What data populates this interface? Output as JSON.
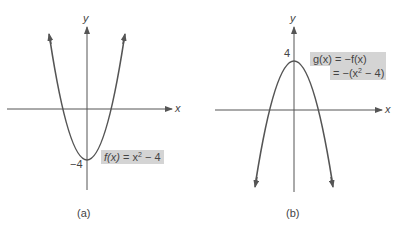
{
  "panels": [
    {
      "id": "a",
      "caption": "(a)",
      "x_axis_label": "x",
      "y_axis_label": "y",
      "y_intercept_label": "−4",
      "function_label": {
        "lhs": "f(x)",
        "rhs_prefix": "= x",
        "exponent": "2",
        "rhs_suffix": " − 4"
      },
      "equation": "f(x) = x^2 - 4",
      "vertex": [
        0,
        -4
      ],
      "opens": "up",
      "x_intercepts": [
        -2,
        2
      ]
    },
    {
      "id": "b",
      "caption": "(b)",
      "x_axis_label": "x",
      "y_axis_label": "y",
      "y_intercept_label": "4",
      "function_label": {
        "line1": "g(x) = −f(x)",
        "line2_prefix": "= −(x",
        "exponent": "2",
        "line2_suffix": " − 4)"
      },
      "equation": "g(x) = -f(x) = -(x^2 - 4)",
      "vertex": [
        0,
        4
      ],
      "opens": "down",
      "x_intercepts": [
        -2,
        2
      ]
    }
  ],
  "colors": {
    "curve": "#555555",
    "axis": "#555555",
    "label_box": "#d4d4d4",
    "text": "#444444"
  }
}
